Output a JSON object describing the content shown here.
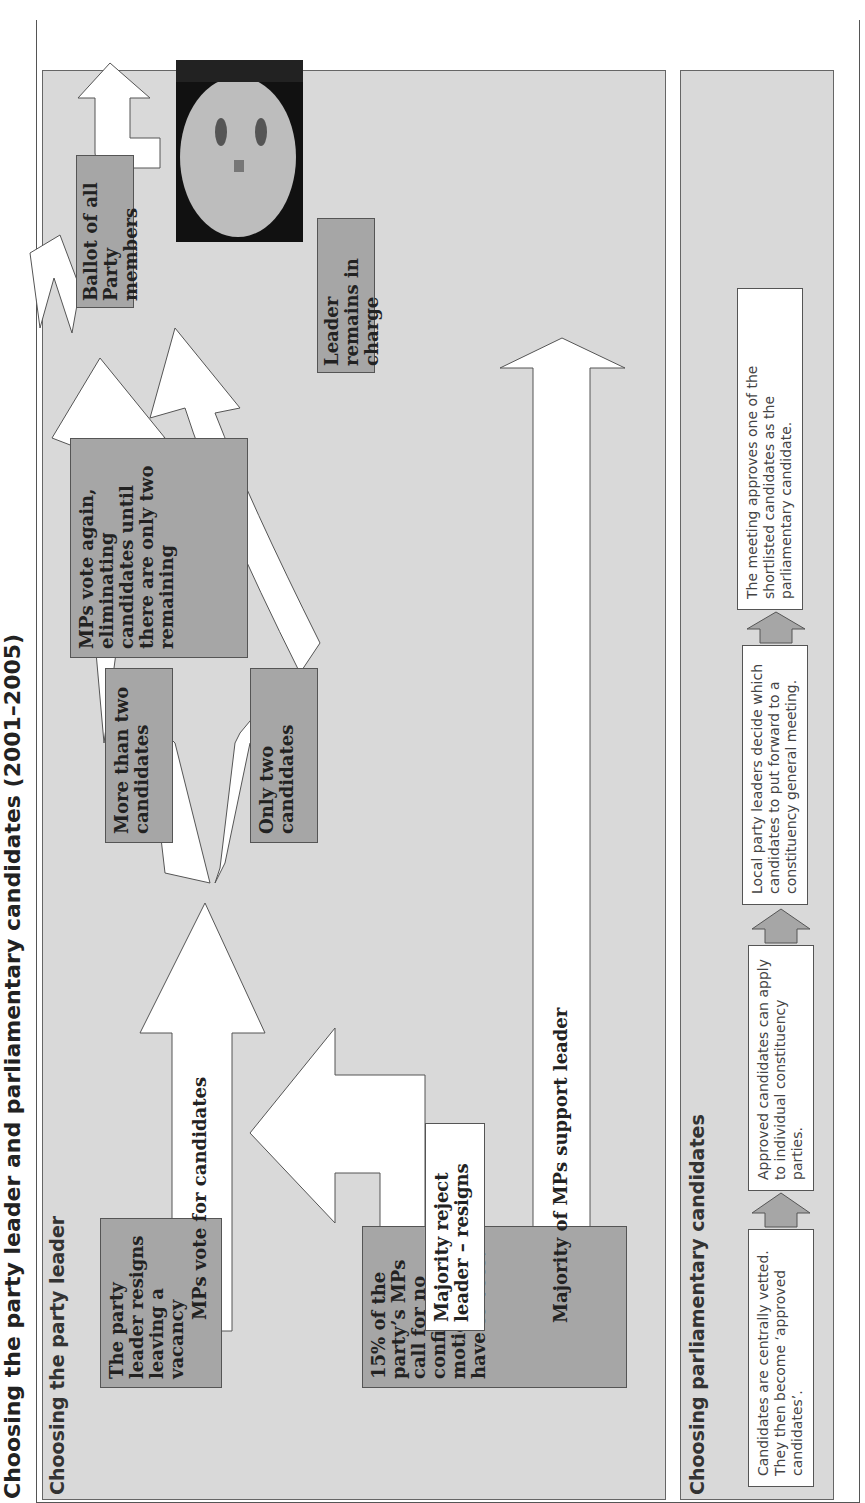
{
  "title": "Choosing the party leader and parliamentary candidates (2001–2005)",
  "leader_panel": {
    "heading": "Choosing the party leader",
    "boxes": {
      "resigns": "The party leader resigns leaving a vacancy",
      "no_confidence": "15% of the party’s MPs call for no confidence motion. MPs have to vote.",
      "mps_vote": "MPs vote for candidates",
      "majority_reject": "Majority reject leader – resigns",
      "majority_support": "Majority of MPs support leader",
      "more_than_two": "More than two candidates",
      "only_two": "Only two candidates",
      "vote_again": "MPs vote again, eliminating candidates until there are only two remaining",
      "ballot": "Ballot of all Party members",
      "remains": "Leader remains in charge"
    },
    "photo_label": "portrait-photo"
  },
  "candidates_panel": {
    "heading": "Choosing parliamentary candidates",
    "steps": [
      "Candidates are centrally vetted. They then become ‘approved candidates’.",
      "Approved candidates can apply to individual constituency parties.",
      "Local party leaders decide which candidates to put forward to a constituency general meeting.",
      "The meeting approves one of the shortlisted candidates as the parliamentary candidate."
    ]
  },
  "colors": {
    "panel": "#d9d9d9",
    "dark_box": "#a6a6a6",
    "arrow": "#ffffff",
    "border": "#555555"
  }
}
